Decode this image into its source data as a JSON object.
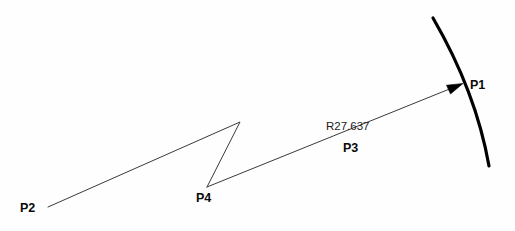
{
  "diagram": {
    "background_color": "#fefefe",
    "line_color": "#3a3a3a",
    "arc_color": "#000000",
    "text_color": "#0a0a0a",
    "labels": {
      "p1": "P1",
      "p2": "P2",
      "p3": "P3",
      "p4": "P4",
      "radius": "R27.637"
    },
    "geometry": {
      "arc": {
        "name": "thick-arc",
        "start": [
          433,
          18
        ],
        "end": [
          489,
          166
        ],
        "control": [
          476,
          92
        ],
        "stroke_width": 3.2
      },
      "leader_line": {
        "name": "radius-leader",
        "start": [
          207,
          187
        ],
        "end": [
          452,
          88
        ],
        "stroke_width": 1
      },
      "arrowhead": {
        "name": "leader-arrowhead",
        "tip": [
          463,
          84
        ],
        "points": "463,83.5 447,85.5 450,93.5"
      },
      "polyline": {
        "name": "zigzag-polyline",
        "points": [
          [
            48,
            207
          ],
          [
            240,
            122
          ],
          [
            207,
            187
          ]
        ],
        "stroke_width": 1
      }
    }
  }
}
